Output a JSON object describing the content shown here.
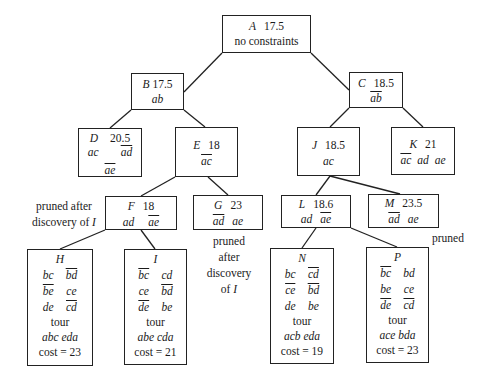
{
  "diagram": {
    "type": "branch-and-bound search tree (TSP)",
    "nodes": {
      "A": {
        "label": "A",
        "bound": "17.5",
        "constraint_text": "no constraints"
      },
      "B": {
        "label": "B",
        "bound": "17.5",
        "edges": [
          {
            "e": "ab",
            "neg": false
          }
        ]
      },
      "C": {
        "label": "C",
        "bound": "18.5",
        "edges": [
          {
            "e": "ab",
            "neg": true
          }
        ]
      },
      "D": {
        "label": "D",
        "bound": "20.5",
        "edges": [
          {
            "e": "ac",
            "neg": false
          },
          {
            "e": "ad",
            "neg": true
          },
          {
            "e": "ae",
            "neg": true
          }
        ]
      },
      "E": {
        "label": "E",
        "bound": "18",
        "edges": [
          {
            "e": "ac",
            "neg": true
          }
        ]
      },
      "J": {
        "label": "J",
        "bound": "18.5",
        "edges": [
          {
            "e": "ac",
            "neg": false
          }
        ]
      },
      "K": {
        "label": "K",
        "bound": "21",
        "edges": [
          {
            "e": "ac",
            "neg": true
          },
          {
            "e": "ad",
            "neg": false
          },
          {
            "e": "ae",
            "neg": false
          }
        ]
      },
      "F": {
        "label": "F",
        "bound": "18",
        "edges": [
          {
            "e": "ad",
            "neg": false
          },
          {
            "e": "ae",
            "neg": true
          }
        ]
      },
      "G": {
        "label": "G",
        "bound": "23",
        "edges": [
          {
            "e": "ad",
            "neg": true
          },
          {
            "e": "ae",
            "neg": false
          }
        ]
      },
      "L": {
        "label": "L",
        "bound": "18.6",
        "edges": [
          {
            "e": "ad",
            "neg": false
          },
          {
            "e": "ae",
            "neg": true
          }
        ]
      },
      "M": {
        "label": "M",
        "bound": "23.5",
        "edges": [
          {
            "e": "ad",
            "neg": true
          },
          {
            "e": "ae",
            "neg": false
          }
        ]
      },
      "H": {
        "label": "H",
        "grid": [
          [
            {
              "e": "bc",
              "neg": false
            },
            {
              "e": "bd",
              "neg": true
            }
          ],
          [
            {
              "e": "be",
              "neg": true
            },
            {
              "e": "ce",
              "neg": false
            }
          ],
          [
            {
              "e": "de",
              "neg": false
            },
            {
              "e": "cd",
              "neg": true
            }
          ]
        ],
        "tour_label": "tour",
        "tour": "abc eda",
        "cost": "cost = 23"
      },
      "I": {
        "label": "I",
        "grid": [
          [
            {
              "e": "bc",
              "neg": true
            },
            {
              "e": "cd",
              "neg": false
            }
          ],
          [
            {
              "e": "ce",
              "neg": false
            },
            {
              "e": "bd",
              "neg": true
            }
          ],
          [
            {
              "e": "de",
              "neg": true
            },
            {
              "e": "be",
              "neg": false
            }
          ]
        ],
        "tour_label": "tour",
        "tour": "abe cda",
        "cost": "cost = 21"
      },
      "N": {
        "label": "N",
        "grid": [
          [
            {
              "e": "bc",
              "neg": false
            },
            {
              "e": "cd",
              "neg": true
            }
          ],
          [
            {
              "e": "ce",
              "neg": true
            },
            {
              "e": "bd",
              "neg": true
            }
          ],
          [
            {
              "e": "de",
              "neg": false
            },
            {
              "e": "be",
              "neg": false
            }
          ]
        ],
        "tour_label": "tour",
        "tour": "acb eda",
        "cost": "cost = 19"
      },
      "P": {
        "label": "P",
        "grid": [
          [
            {
              "e": "bc",
              "neg": true
            },
            {
              "e": "bd",
              "neg": false
            }
          ],
          [
            {
              "e": "be",
              "neg": false
            },
            {
              "e": "ce",
              "neg": false
            }
          ],
          [
            {
              "e": "de",
              "neg": true
            },
            {
              "e": "cd",
              "neg": true
            }
          ]
        ],
        "tour_label": "tour",
        "tour": "ace bda",
        "cost": "cost = 23"
      }
    },
    "annotations": {
      "F_note": {
        "line1": "pruned after",
        "line2_prefix": "discovery of ",
        "line2_var": "I"
      },
      "G_note": {
        "line1": "pruned",
        "line2": "after",
        "line3": "discovery",
        "line4_prefix": "of ",
        "line4_var": "I"
      },
      "M_note": {
        "text": "pruned"
      }
    },
    "tree_edges": [
      [
        "A",
        "B"
      ],
      [
        "A",
        "C"
      ],
      [
        "B",
        "D"
      ],
      [
        "B",
        "E"
      ],
      [
        "C",
        "J"
      ],
      [
        "C",
        "K"
      ],
      [
        "E",
        "F"
      ],
      [
        "E",
        "G"
      ],
      [
        "J",
        "L"
      ],
      [
        "J",
        "M"
      ],
      [
        "F",
        "H"
      ],
      [
        "F",
        "I"
      ],
      [
        "L",
        "N"
      ],
      [
        "L",
        "P"
      ]
    ]
  }
}
